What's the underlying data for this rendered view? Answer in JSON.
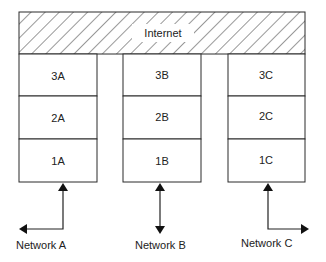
{
  "internet": {
    "label": "Internet",
    "pattern": "diagonal-hatch"
  },
  "stacks": [
    {
      "id": "A",
      "layers": [
        "3A",
        "2A",
        "1A"
      ],
      "network_label": "Network A",
      "arrow": "up-from-left"
    },
    {
      "id": "B",
      "layers": [
        "3B",
        "2B",
        "1B"
      ],
      "network_label": "Network B",
      "arrow": "bidirectional-vertical"
    },
    {
      "id": "C",
      "layers": [
        "3C",
        "2C",
        "1C"
      ],
      "network_label": "Network C",
      "arrow": "up-from-right"
    }
  ],
  "colors": {
    "stroke": "#2a2a2a",
    "background": "#ffffff",
    "text": "#222222"
  }
}
